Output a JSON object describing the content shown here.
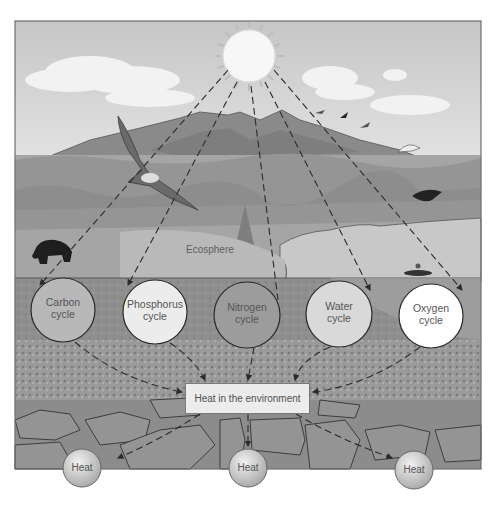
{
  "labels": {
    "ecosphere": "Ecosphere",
    "heat_environment": "Heat in the environment"
  },
  "cycles": [
    {
      "line1": "Carbon",
      "line2": "cycle",
      "fill": "#b8b8b8"
    },
    {
      "line1": "Phosphorus",
      "line2": "cycle",
      "fill": "#ececec"
    },
    {
      "line1": "Nitrogen",
      "line2": "cycle",
      "fill": "#9c9c9c"
    },
    {
      "line1": "Water",
      "line2": "cycle",
      "fill": "#d9d9d9"
    },
    {
      "line1": "Oxygen",
      "line2": "cycle",
      "fill": "#ffffff"
    }
  ],
  "heat_nodes": [
    {
      "label": "Heat"
    },
    {
      "label": "Heat"
    },
    {
      "label": "Heat"
    }
  ],
  "colors": {
    "sky": "#cfcfcf",
    "mountain": "#8a8a8a",
    "vegetation": "#9a9a9a",
    "lake": "#c4c4c4",
    "soil": "#8e8e8e",
    "rock": "#929292",
    "sun": "#f7f7f7",
    "dash": "#2a2a2a"
  }
}
